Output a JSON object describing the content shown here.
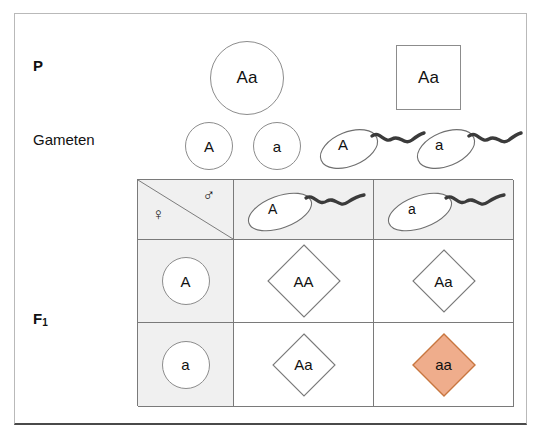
{
  "figure": {
    "labels": {
      "p": "P",
      "gameten": "Gameten",
      "f1": "F",
      "f1_sub": "1"
    },
    "parents": [
      {
        "name": "female-parent",
        "genotype": "Aa",
        "shape": "circle"
      },
      {
        "name": "male-parent",
        "genotype": "Aa",
        "shape": "square"
      }
    ],
    "gametes": {
      "eggs": [
        {
          "allele": "A",
          "icon": "egg-cell-icon"
        },
        {
          "allele": "a",
          "icon": "egg-cell-icon"
        }
      ],
      "sperm": [
        {
          "allele": "A",
          "icon": "sperm-cell-icon"
        },
        {
          "allele": "a",
          "icon": "sperm-cell-icon"
        }
      ]
    },
    "punnett": {
      "corner": {
        "female_symbol": "♀",
        "male_symbol": "♂"
      },
      "column_headers": [
        {
          "allele": "A",
          "icon": "sperm-cell-icon"
        },
        {
          "allele": "a",
          "icon": "sperm-cell-icon"
        }
      ],
      "row_headers": [
        {
          "allele": "A",
          "icon": "egg-cell-icon"
        },
        {
          "allele": "a",
          "icon": "egg-cell-icon"
        }
      ],
      "cells": [
        [
          {
            "genotype": "AA",
            "highlighted": false,
            "size": "big"
          },
          {
            "genotype": "Aa",
            "highlighted": false,
            "size": "small"
          }
        ],
        [
          {
            "genotype": "Aa",
            "highlighted": false,
            "size": "small"
          },
          {
            "genotype": "aa",
            "highlighted": true,
            "size": "small"
          }
        ]
      ]
    },
    "colors": {
      "highlight_fill": "#efad8c",
      "highlight_stroke": "#c8763f",
      "cell_shade": "#f0f0f0",
      "line": "#7a7a7a",
      "outline": "#8c8c8c",
      "frame": "#b9b9b9",
      "frame_bottom": "#4a4a4a"
    }
  }
}
